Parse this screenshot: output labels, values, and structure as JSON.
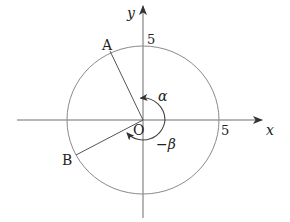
{
  "diagram": {
    "axes": {
      "x_label": "x",
      "y_label": "y"
    },
    "circle": {
      "radius_label_x": "5",
      "radius_label_y": "5"
    },
    "points": {
      "origin": "O",
      "A": "A",
      "B": "B"
    },
    "angles": {
      "alpha": "α",
      "minus_beta": "−β"
    },
    "colors": {
      "axis": "#6e6e6e",
      "circle": "#8a8a8a",
      "text": "#222222"
    }
  }
}
